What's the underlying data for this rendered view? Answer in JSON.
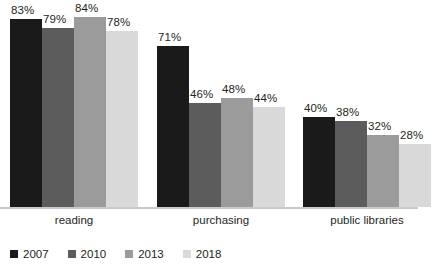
{
  "chart_data": {
    "type": "bar",
    "title": "",
    "subtitle": "",
    "xlabel": "",
    "ylabel": "",
    "ylim": [
      0,
      90
    ],
    "grid": false,
    "legend_position": "bottom-left",
    "value_suffix": "%",
    "categories": [
      "reading",
      "purchasing",
      "public libraries"
    ],
    "series": [
      {
        "name": "2007",
        "color": "#1a1a1a",
        "values": [
          83,
          71,
          40
        ]
      },
      {
        "name": "2010",
        "color": "#5c5c5c",
        "values": [
          79,
          46,
          38
        ]
      },
      {
        "name": "2013",
        "color": "#9b9b9b",
        "values": [
          84,
          48,
          32
        ]
      },
      {
        "name": "2018",
        "color": "#d9d9d9",
        "values": [
          78,
          44,
          28
        ]
      }
    ],
    "data_labels": [
      [
        "83%",
        "79%",
        "84%",
        "78%"
      ],
      [
        "71%",
        "46%",
        "48%",
        "44%"
      ],
      [
        "40%",
        "38%",
        "32%",
        "28%"
      ]
    ],
    "axis_color": "#c9c9c9",
    "background": "#ffffff"
  }
}
